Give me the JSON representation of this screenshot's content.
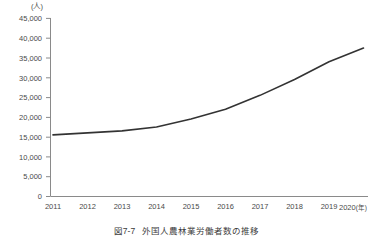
{
  "chart_data": {
    "type": "line",
    "title": "外国人農林業労働者数の推移",
    "figure_number": "図7-7",
    "unit_label": "(人)",
    "xlabel": "(年)",
    "ylabel": "",
    "grid": false,
    "legend": false,
    "line_color": "#333333",
    "categories": [
      "2011",
      "2012",
      "2013",
      "2014",
      "2015",
      "2016",
      "2017",
      "2018",
      "2019",
      "2020"
    ],
    "values": [
      15500,
      16000,
      16500,
      17500,
      19500,
      22000,
      25500,
      29500,
      34000,
      37500
    ],
    "xtick_labels": [
      "2011",
      "2012",
      "2013",
      "2014",
      "2015",
      "2016",
      "2017",
      "2018",
      "2019",
      "2020"
    ],
    "last_xtick_suffix": "(年)",
    "ytick_labels": [
      "0",
      "5,000",
      "10,000",
      "15,000",
      "20,000",
      "25,000",
      "30,000",
      "35,000",
      "40,000",
      "45,000"
    ],
    "ytick_values": [
      0,
      5000,
      10000,
      15000,
      20000,
      25000,
      30000,
      35000,
      40000,
      45000
    ],
    "ylim": [
      0,
      45000
    ],
    "xlim": [
      2011,
      2020
    ]
  },
  "caption": {
    "number": "図7-7",
    "text": "外国人農林業労働者数の推移"
  }
}
